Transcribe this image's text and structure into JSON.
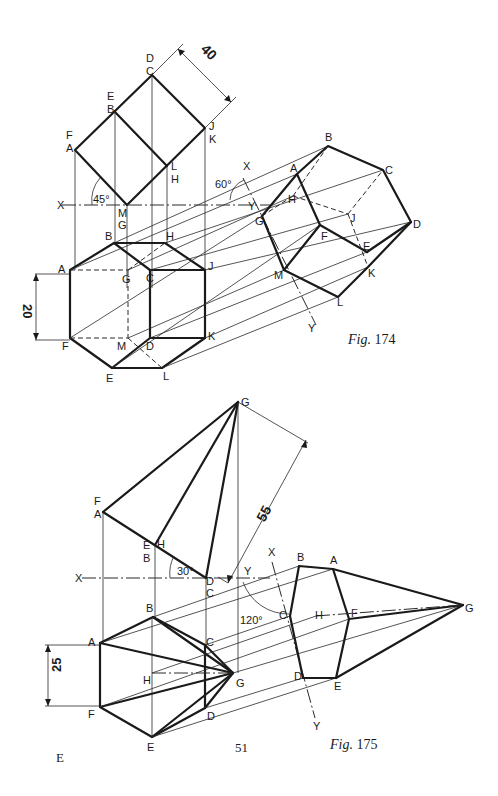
{
  "figures": [
    {
      "id": "fig174",
      "caption_prefix": "Fig.",
      "caption_number": "174",
      "dimensions": {
        "side": "40",
        "height": "20"
      },
      "angles": {
        "elevation": "45°",
        "auxiliary_plane": "60°"
      },
      "elevation_labels": [
        "F/A",
        "E/B",
        "D/C",
        "J/K",
        "L/H",
        "M/G"
      ],
      "plan_labels": [
        "A",
        "B",
        "H",
        "J",
        "K",
        "L",
        "E",
        "F",
        "C",
        "D",
        "G",
        "M"
      ],
      "aux_labels": [
        "A",
        "B",
        "C",
        "D",
        "E",
        "F",
        "G",
        "H",
        "J",
        "K",
        "L",
        "M"
      ],
      "xy": {
        "x": "X",
        "y": "Y"
      }
    },
    {
      "id": "fig175",
      "caption_prefix": "Fig.",
      "caption_number": "175",
      "dimensions": {
        "slant": "55",
        "side": "25"
      },
      "angles": {
        "elevation": "30°",
        "auxiliary_plane": "120°"
      },
      "elevation_labels": [
        "G",
        "F/A",
        "E/B",
        "D/C",
        "H"
      ],
      "plan_labels": [
        "A",
        "B",
        "C",
        "D",
        "E",
        "F",
        "G",
        "H"
      ],
      "aux_labels": [
        "A",
        "B",
        "C",
        "D",
        "E",
        "F",
        "G",
        "H"
      ],
      "xy": {
        "x": "X",
        "y": "Y"
      }
    }
  ],
  "page": {
    "number": "51",
    "marker": "E"
  },
  "labels": {
    "f174": {
      "elev_FA": "F",
      "elev_FA2": "A",
      "elev_EB": "E",
      "elev_EB2": "B",
      "elev_DC": "D",
      "elev_DC2": "C",
      "elev_JK": "J",
      "elev_JK2": "K",
      "elev_LH": "L",
      "elev_LH2": "H",
      "elev_MG": "M",
      "elev_MG2": "G",
      "dim40": "40",
      "ang45": "45°",
      "ang60": "60°",
      "X": "X",
      "Y": "Y",
      "X1": "X",
      "Y1": "Y",
      "pA": "A",
      "pB": "B",
      "pH": "H",
      "pJ": "J",
      "pK": "K",
      "pL": "L",
      "pE": "E",
      "pF": "F",
      "pC": "C",
      "pD": "D",
      "pG": "G",
      "pM": "M",
      "dim20": "20",
      "aA": "A",
      "aB": "B",
      "aC": "C",
      "aD": "D",
      "aE": "E",
      "aF": "F",
      "aG": "G",
      "aH": "H",
      "aJ": "J",
      "aK": "K",
      "aL": "L",
      "aM": "M"
    },
    "f175": {
      "eG": "G",
      "eF": "F",
      "eA": "A",
      "eE": "E",
      "eB": "B",
      "eD": "D",
      "eC": "C",
      "eH": "H",
      "dim55": "55",
      "ang30": "30°",
      "ang120": "120°",
      "X": "X",
      "Y": "Y",
      "X1": "X",
      "Y1": "Y",
      "pA": "A",
      "pB": "B",
      "pC": "C",
      "pD": "D",
      "pE": "E",
      "pF": "F",
      "pG": "G",
      "pH": "H",
      "dim25": "25",
      "aA": "A",
      "aB": "B",
      "aC": "C",
      "aD": "D",
      "aE": "E",
      "aF": "F",
      "aG": "G",
      "aH": "H"
    }
  }
}
